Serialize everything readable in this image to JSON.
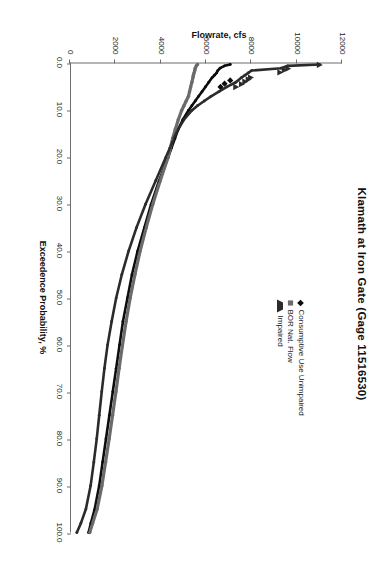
{
  "figure": {
    "title": "Klamath at Iron Gate (Gage 11516530)",
    "rotation_note": "90"
  },
  "legend": {
    "position": "top-right-inside-plot",
    "entries": [
      {
        "label": "Consumptive Use Unimpaired",
        "marker": "diamond-marker",
        "color": "#0d0d0d"
      },
      {
        "label": "BOR Nat. Flow",
        "marker": "square-marker",
        "color": "#6b6b6b"
      },
      {
        "label": "Impaired",
        "marker": "triangle-marker",
        "color": "#2b2b2b"
      }
    ]
  },
  "axes": {
    "x": {
      "title": "Exceedence Probability, %",
      "ticks": [
        "0.0",
        "10.0",
        "20.0",
        "30.0",
        "40.0",
        "50.0",
        "60.0",
        "70.0",
        "80.0",
        "90.0",
        "100.0"
      ],
      "min": 0,
      "max": 100
    },
    "y": {
      "title": "Flowrate, cfs",
      "ticks": [
        "0",
        "2000",
        "4000",
        "6000",
        "8000",
        "10000",
        "12000"
      ],
      "min": 0,
      "max": 12000
    }
  },
  "chart_data": {
    "type": "line",
    "title": "Klamath at Iron Gate (Gage 11516530)",
    "xlabel": "Exceedence Probability, %",
    "ylabel": "Flowrate, cfs",
    "xlim": [
      0,
      100
    ],
    "ylim": [
      0,
      12000
    ],
    "grid": false,
    "legend_position": "upper right",
    "x": [
      0.2,
      0.5,
      1,
      1.5,
      2,
      2.5,
      3,
      4,
      5,
      6,
      7,
      8,
      9,
      10,
      12,
      14,
      16,
      18,
      20,
      25,
      30,
      35,
      40,
      45,
      50,
      55,
      60,
      65,
      70,
      75,
      80,
      85,
      90,
      95,
      98,
      100
    ],
    "series": [
      {
        "name": "Consumptive Use Unimpaired",
        "marker": "diamond",
        "color": "#0d0d0d",
        "values": [
          7050,
          6800,
          6600,
          6500,
          6450,
          6350,
          6250,
          6100,
          5950,
          5800,
          5650,
          5500,
          5350,
          5200,
          4950,
          4750,
          4600,
          4450,
          4300,
          3900,
          3550,
          3250,
          2950,
          2700,
          2500,
          2300,
          2150,
          2000,
          1850,
          1700,
          1550,
          1400,
          1250,
          1050,
          880,
          780
        ]
      },
      {
        "name": "BOR Nat. Flow",
        "marker": "square",
        "color": "#6b6b6b",
        "values": [
          5600,
          5550,
          5500,
          5480,
          5450,
          5420,
          5400,
          5350,
          5300,
          5250,
          5200,
          5100,
          5000,
          4900,
          4750,
          4620,
          4500,
          4400,
          4300,
          3950,
          3620,
          3330,
          3060,
          2830,
          2620,
          2440,
          2280,
          2130,
          1990,
          1840,
          1690,
          1530,
          1370,
          1160,
          960,
          830
        ]
      },
      {
        "name": "Impaired",
        "marker": "triangle",
        "color": "#2b2b2b",
        "values": [
          11000,
          9600,
          9300,
          8000,
          7850,
          7700,
          7550,
          7300,
          6900,
          6550,
          6200,
          5900,
          5600,
          5350,
          5000,
          4750,
          4550,
          4380,
          4200,
          3750,
          3300,
          2900,
          2550,
          2250,
          2000,
          1800,
          1620,
          1480,
          1360,
          1250,
          1140,
          1010,
          870,
          660,
          440,
          260
        ]
      }
    ],
    "scatter_outliers": [
      {
        "series": "Impaired",
        "x": 0.3,
        "y": 11000
      },
      {
        "series": "Impaired",
        "x": 1.1,
        "y": 9600
      },
      {
        "series": "Impaired",
        "x": 1.4,
        "y": 9450
      },
      {
        "series": "Impaired",
        "x": 1.9,
        "y": 9250
      },
      {
        "series": "Impaired",
        "x": 3.0,
        "y": 7950
      },
      {
        "series": "Impaired",
        "x": 3.4,
        "y": 7850
      },
      {
        "series": "Impaired",
        "x": 3.9,
        "y": 7700
      },
      {
        "series": "Impaired",
        "x": 4.4,
        "y": 7550
      },
      {
        "series": "Impaired",
        "x": 5.0,
        "y": 7300
      },
      {
        "series": "Consumptive Use Unimpaired",
        "x": 3.6,
        "y": 7050
      },
      {
        "series": "Consumptive Use Unimpaired",
        "x": 4.3,
        "y": 6800
      },
      {
        "series": "Consumptive Use Unimpaired",
        "x": 5.0,
        "y": 6620
      }
    ]
  }
}
